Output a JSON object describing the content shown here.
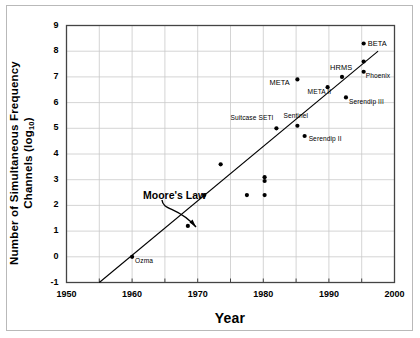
{
  "chart_data": {
    "type": "scatter",
    "title": "",
    "xlabel": "Year",
    "ylabel": "Number of Simultaneous Frequency Channels (log10)",
    "ylabel_main": "Number of Simultaneous Frequency",
    "ylabel_second": "Channels (log",
    "ylabel_sub": "10",
    "ylabel_close": ")",
    "xlim": [
      1950,
      2000
    ],
    "ylim": [
      -1,
      9
    ],
    "xticks": [
      1950,
      1960,
      1970,
      1980,
      1990,
      2000
    ],
    "xtick_labels": [
      "1950",
      "1960",
      "1970",
      "1980",
      "1990",
      "2000"
    ],
    "xminor_step": 5,
    "yticks": [
      -1,
      0,
      1,
      2,
      3,
      4,
      5,
      6,
      7,
      8,
      9
    ],
    "ytick_labels": [
      "-1",
      "0",
      "1",
      "2",
      "3",
      "4",
      "5",
      "6",
      "7",
      "8",
      "9"
    ],
    "grid": true,
    "grid_color": "#c9c9c9",
    "legend": "none",
    "marker_color": "#000000",
    "trendline": {
      "name": "Moore's Law",
      "x": [
        1955.0,
        1997.5
      ],
      "y": [
        -1.0,
        8.0
      ],
      "color": "#000000"
    },
    "annotations": [
      {
        "text": "Moore's Law",
        "x": 1968.2,
        "y": 2.45
      }
    ],
    "points": [
      {
        "label": "Ozma",
        "x": 1960.0,
        "y": 0.0,
        "label_dx": 3,
        "label_dy": 4
      },
      {
        "label": "",
        "x": 1968.5,
        "y": 1.2,
        "label_dx": 0,
        "label_dy": 0
      },
      {
        "label": "",
        "x": 1971.0,
        "y": 2.4,
        "label_dx": 0,
        "label_dy": 0
      },
      {
        "label": "",
        "x": 1973.5,
        "y": 3.6,
        "label_dx": 0,
        "label_dy": 0
      },
      {
        "label": "",
        "x": 1977.5,
        "y": 2.4,
        "label_dx": 0,
        "label_dy": 0
      },
      {
        "label": "",
        "x": 1980.2,
        "y": 3.1,
        "label_dx": 0,
        "label_dy": 0
      },
      {
        "label": "",
        "x": 1980.2,
        "y": 2.95,
        "label_dx": 0,
        "label_dy": 0
      },
      {
        "label": "",
        "x": 1980.2,
        "y": 2.4,
        "label_dx": 0,
        "label_dy": 0
      },
      {
        "label": "Suitcase SETI",
        "x": 1982.0,
        "y": 5.0,
        "label_dx": -46,
        "label_dy": -10
      },
      {
        "label": "Sentinel",
        "x": 1985.2,
        "y": 5.1,
        "label_dx": -14,
        "label_dy": -10
      },
      {
        "label": "Serendip II",
        "x": 1986.3,
        "y": 4.7,
        "label_dx": 4,
        "label_dy": 3
      },
      {
        "label": "META",
        "x": 1985.2,
        "y": 6.9,
        "label_dx": -28,
        "label_dy": 3
      },
      {
        "label": "META II",
        "x": 1989.8,
        "y": 6.6,
        "label_dx": -20,
        "label_dy": 5
      },
      {
        "label": "HRMS",
        "x": 1992.0,
        "y": 7.0,
        "label_dx": -12,
        "label_dy": -10
      },
      {
        "label": "Serendip III",
        "x": 1992.6,
        "y": 6.2,
        "label_dx": 3,
        "label_dy": 5
      },
      {
        "label": "BETA",
        "x": 1995.3,
        "y": 8.3,
        "label_dx": 4,
        "label_dy": 0
      },
      {
        "label": "",
        "x": 1995.3,
        "y": 7.6,
        "label_dx": 0,
        "label_dy": 0
      },
      {
        "label": "Phoenix",
        "x": 1995.3,
        "y": 7.2,
        "label_dx": 2,
        "label_dy": 4
      }
    ]
  }
}
